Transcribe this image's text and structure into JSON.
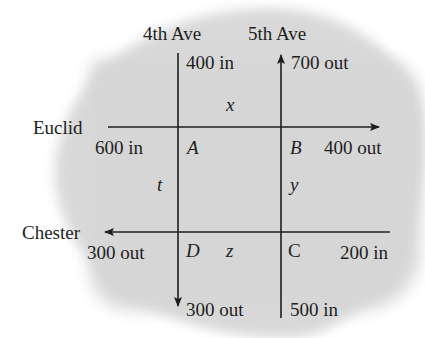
{
  "streets": {
    "avenue_1": "4th Ave",
    "avenue_2": "5th Ave",
    "street_1": "Euclid",
    "street_2": "Chester"
  },
  "intersections": {
    "a": "A",
    "b": "B",
    "c": "C",
    "d": "D"
  },
  "unknowns": {
    "x": "x",
    "y": "y",
    "z": "z",
    "t": "t"
  },
  "flows": {
    "fourth_top": "400 in",
    "fifth_top": "700 out",
    "euclid_left": "600 in",
    "euclid_right": "400 out",
    "chester_left": "300 out",
    "chester_right": "200 in",
    "fourth_bottom": "300 out",
    "fifth_bottom": "500 in"
  },
  "colors": {
    "background_blob": "#d9d9d9",
    "line": "#1e1e1e"
  }
}
